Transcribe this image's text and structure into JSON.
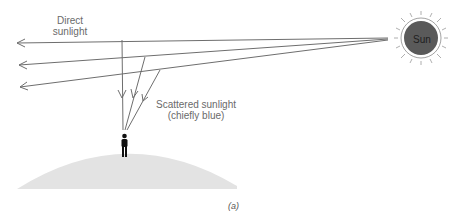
{
  "diagram": {
    "labels": {
      "direct": [
        "Direct",
        "sunlight"
      ],
      "scattered": [
        "Scattered sunlight",
        "(chiefly blue)"
      ],
      "sun": "Sun",
      "caption": "(a)"
    },
    "colors": {
      "ray": "#6e6e6e",
      "sun_fill": "#5a5a5a",
      "sun_outline": "#8a8a8a",
      "ground": "#e3e3e3",
      "person": "#111111"
    }
  }
}
